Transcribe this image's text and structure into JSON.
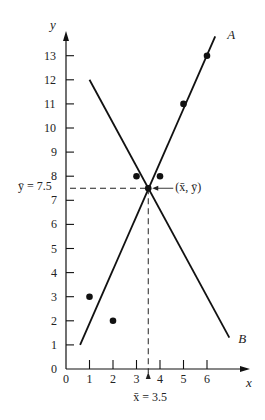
{
  "chart_data": {
    "type": "scatter",
    "title": "",
    "xlabel": "x",
    "ylabel": "y",
    "xlim": [
      0,
      7.5
    ],
    "ylim": [
      0,
      14
    ],
    "x_ticks": [
      0,
      1,
      2,
      3,
      4,
      5,
      6
    ],
    "y_ticks": [
      0,
      1,
      2,
      3,
      4,
      5,
      6,
      7,
      8,
      9,
      10,
      11,
      12,
      13
    ],
    "grid": false,
    "points": [
      {
        "x": 1,
        "y": 3
      },
      {
        "x": 2,
        "y": 2
      },
      {
        "x": 3,
        "y": 8
      },
      {
        "x": 4,
        "y": 8
      },
      {
        "x": 5,
        "y": 11
      },
      {
        "x": 6,
        "y": 13
      },
      {
        "x": 3.5,
        "y": 7.5
      }
    ],
    "lines": [
      {
        "name": "A",
        "x1": 0.6,
        "y1": 1.0,
        "x2": 6.35,
        "y2": 13.8
      },
      {
        "name": "B",
        "x1": 1.0,
        "y1": 12.0,
        "x2": 6.95,
        "y2": 1.3
      }
    ],
    "mean": {
      "x": 3.5,
      "y": 7.5
    },
    "annotations": {
      "mean_point": "(x̄, ȳ)",
      "x_mean": "x̄ = 3.5",
      "y_mean": "ȳ = 7.5",
      "line_a": "A",
      "line_b": "B"
    }
  }
}
